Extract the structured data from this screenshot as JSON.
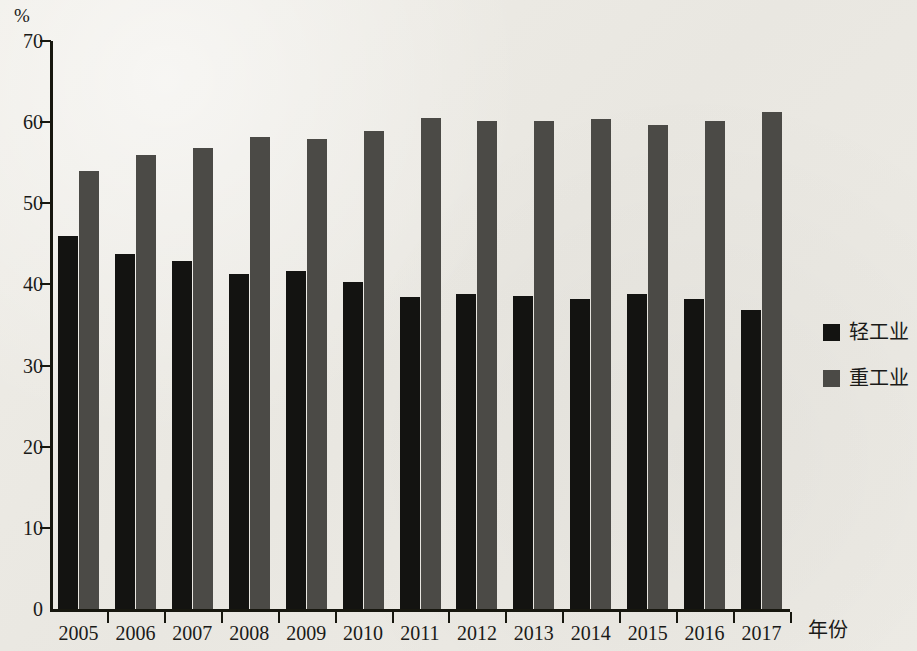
{
  "chart_data": {
    "type": "bar",
    "title": "",
    "subtitle": "",
    "unit_label": "%",
    "xlabel": "年份",
    "ylabel": "",
    "ylim": [
      0,
      70
    ],
    "ytick_step": 10,
    "yticks": [
      0,
      10,
      20,
      30,
      40,
      50,
      60,
      70
    ],
    "ytick_labels": [
      "0",
      "10",
      "20",
      "30",
      "40",
      "50",
      "60",
      "70"
    ],
    "grid": false,
    "legend_position": "right",
    "categories": [
      "2005",
      "2006",
      "2007",
      "2008",
      "2009",
      "2010",
      "2011",
      "2012",
      "2013",
      "2014",
      "2015",
      "2016",
      "2017"
    ],
    "series": [
      {
        "name": "轻工业",
        "color": "#131311",
        "values": [
          46.0,
          43.8,
          42.9,
          41.3,
          41.6,
          40.3,
          38.5,
          38.8,
          38.6,
          38.2,
          38.8,
          38.2,
          36.9
        ]
      },
      {
        "name": "重工业",
        "color": "#4b4a46",
        "values": [
          54.0,
          56.0,
          56.8,
          58.2,
          57.9,
          58.9,
          60.5,
          60.2,
          60.1,
          60.4,
          59.6,
          60.1,
          61.3
        ]
      }
    ]
  },
  "legend": {
    "items": [
      {
        "label": "轻工业",
        "color": "#131311"
      },
      {
        "label": "重工业",
        "color": "#4b4a46"
      }
    ]
  }
}
